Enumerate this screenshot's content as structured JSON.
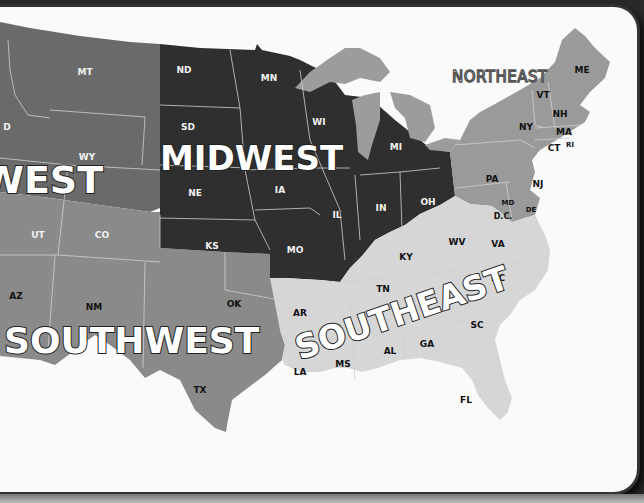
{
  "map": {
    "title": "United States Regions",
    "colors": {
      "west": "#6a6a6a",
      "midwest": "#2f2f2f",
      "northeast": "#9a9a9a",
      "southwest": "#8a8a8a",
      "southeast": "#d6d6d6",
      "great_lakes": "#9c9c9c",
      "background": "#fafafa",
      "frame": "#333333"
    },
    "regions": {
      "west": "WEST",
      "midwest": "MIDWEST",
      "northeast": "NORTHEAST",
      "southwest": "SOUTHWEST",
      "southeast": "SOUTHEAST"
    },
    "states": {
      "MT": "MT",
      "ID": "D",
      "WY": "WY",
      "UT": "UT",
      "CO": "CO",
      "AZ": "AZ",
      "NM": "NM",
      "OK": "OK",
      "TX": "TX",
      "ND": "ND",
      "SD": "SD",
      "NE": "NE",
      "KS": "KS",
      "MN": "MN",
      "IA": "IA",
      "MO": "MO",
      "WI": "WI",
      "IL": "IL",
      "MI": "MI",
      "IN": "IN",
      "OH": "OH",
      "ME": "ME",
      "VT": "VT",
      "NH": "NH",
      "NY": "NY",
      "MA": "MA",
      "CT": "CT",
      "RI": "RI",
      "PA": "PA",
      "NJ": "NJ",
      "MD": "MD",
      "DE": "DE",
      "DC": "D.C.",
      "KY": "KY",
      "WV": "WV",
      "VA": "VA",
      "TN": "TN",
      "NC": "NC",
      "AR": "AR",
      "SC": "SC",
      "GA": "GA",
      "AL": "AL",
      "MS": "MS",
      "LA": "LA",
      "FL": "FL"
    }
  }
}
